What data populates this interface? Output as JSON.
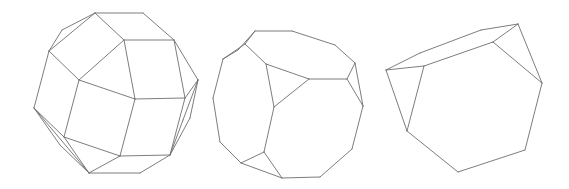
{
  "figure": {
    "background": "#ffffff",
    "stroke_color": "#6e6e6e",
    "polyhedra": [
      {
        "name": "rhombicuboctahedron-like",
        "edges": [
          [
            95,
            13,
            143,
            13
          ],
          [
            143,
            13,
            174,
            40
          ],
          [
            95,
            13,
            49,
            51
          ],
          [
            95,
            13,
            124,
            40
          ],
          [
            95,
            13,
            62,
            30
          ],
          [
            62,
            30,
            49,
            51
          ],
          [
            124,
            40,
            174,
            40
          ],
          [
            124,
            40,
            79,
            80
          ],
          [
            49,
            51,
            79,
            80
          ],
          [
            124,
            40,
            135,
            99
          ],
          [
            174,
            40,
            185,
            98
          ],
          [
            174,
            40,
            198,
            80
          ],
          [
            198,
            80,
            185,
            98
          ],
          [
            79,
            80,
            135,
            99
          ],
          [
            135,
            99,
            185,
            98
          ],
          [
            49,
            51,
            34,
            108
          ],
          [
            79,
            80,
            64,
            137
          ],
          [
            34,
            108,
            64,
            137
          ],
          [
            135,
            99,
            120,
            156
          ],
          [
            185,
            98,
            170,
            155
          ],
          [
            120,
            156,
            170,
            155
          ],
          [
            64,
            137,
            120,
            156
          ],
          [
            34,
            108,
            89,
            173
          ],
          [
            64,
            137,
            89,
            173
          ],
          [
            120,
            156,
            89,
            173
          ],
          [
            89,
            173,
            140,
            173
          ],
          [
            140,
            173,
            170,
            155
          ],
          [
            198,
            80,
            183,
            120
          ],
          [
            183,
            120,
            170,
            155
          ],
          [
            198,
            80,
            190,
            118
          ],
          [
            190,
            118,
            170,
            155
          ],
          [
            34,
            108,
            60,
            145
          ],
          [
            60,
            145,
            89,
            173
          ]
        ]
      },
      {
        "name": "truncated-cube-like",
        "edges": [
          [
            255,
            31,
            292,
            31
          ],
          [
            292,
            31,
            335,
            45
          ],
          [
            335,
            45,
            355,
            63
          ],
          [
            255,
            31,
            245,
            44
          ],
          [
            255,
            31,
            238,
            50
          ],
          [
            238,
            50,
            223,
            59
          ],
          [
            245,
            44,
            223,
            59
          ],
          [
            245,
            44,
            266,
            64
          ],
          [
            266,
            64,
            309,
            79
          ],
          [
            309,
            79,
            347,
            79
          ],
          [
            347,
            79,
            355,
            63
          ],
          [
            266,
            64,
            274,
            107
          ],
          [
            274,
            107,
            309,
            79
          ],
          [
            347,
            79,
            363,
            106
          ],
          [
            355,
            63,
            363,
            106
          ],
          [
            223,
            59,
            213,
            98
          ],
          [
            213,
            98,
            220,
            142
          ],
          [
            220,
            142,
            241,
            163
          ],
          [
            274,
            107,
            264,
            152
          ],
          [
            264,
            152,
            241,
            163
          ],
          [
            264,
            152,
            282,
            178
          ],
          [
            241,
            163,
            282,
            178
          ],
          [
            282,
            178,
            320,
            177
          ],
          [
            320,
            177,
            352,
            149
          ],
          [
            352,
            149,
            363,
            106
          ]
        ]
      },
      {
        "name": "truncated-tetrahedron-like",
        "edges": [
          [
            386,
            70,
            420,
            53
          ],
          [
            420,
            53,
            481,
            30
          ],
          [
            481,
            30,
            518,
            24
          ],
          [
            386,
            70,
            424,
            66
          ],
          [
            424,
            66,
            493,
            42
          ],
          [
            493,
            42,
            518,
            24
          ],
          [
            424,
            66,
            407,
            131
          ],
          [
            386,
            70,
            407,
            131
          ],
          [
            493,
            42,
            542,
            83
          ],
          [
            518,
            24,
            542,
            83
          ],
          [
            407,
            131,
            458,
            172
          ],
          [
            458,
            172,
            525,
            150
          ],
          [
            525,
            150,
            542,
            83
          ]
        ]
      }
    ]
  }
}
